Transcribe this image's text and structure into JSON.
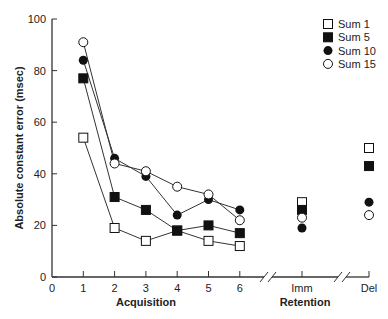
{
  "chart_data": {
    "type": "line",
    "title": "",
    "xlabel": "Acquisition",
    "xlabel_secondary": "Retention",
    "ylabel": "Absolute constant error (msec)",
    "ylim": [
      0,
      100
    ],
    "yticks": [
      0,
      20,
      40,
      60,
      80,
      100
    ],
    "xticks": [
      "0",
      "1",
      "2",
      "3",
      "4",
      "5",
      "6",
      "Imm",
      "Del"
    ],
    "categories": [
      "1",
      "2",
      "3",
      "4",
      "5",
      "6",
      "Imm",
      "Del"
    ],
    "grid": false,
    "legend_position": "top-right",
    "axis_breaks": [
      "between 6 and Imm",
      "between Imm and Del"
    ],
    "connected_segment": [
      "1",
      "2",
      "3",
      "4",
      "5",
      "6"
    ],
    "series": [
      {
        "name": "Sum 1",
        "marker": "open-square",
        "values": [
          54,
          19,
          14,
          18,
          14,
          12,
          29,
          50
        ]
      },
      {
        "name": "Sum 5",
        "marker": "filled-square",
        "values": [
          77,
          31,
          26,
          18,
          20,
          17,
          26,
          43
        ]
      },
      {
        "name": "Sum 10",
        "marker": "filled-circle",
        "values": [
          84,
          46,
          39,
          24,
          30,
          26,
          19,
          29
        ]
      },
      {
        "name": "Sum 15",
        "marker": "open-circle",
        "values": [
          91,
          44,
          41,
          35,
          32,
          22,
          23,
          24
        ]
      }
    ]
  },
  "legend": {
    "items": [
      {
        "label": "Sum 1",
        "marker": "open-square"
      },
      {
        "label": "Sum 5",
        "marker": "filled-square"
      },
      {
        "label": "Sum 10",
        "marker": "filled-circle"
      },
      {
        "label": "Sum 15",
        "marker": "open-circle"
      }
    ]
  },
  "axes": {
    "y_title": "Absolute constant error (msec)",
    "x_title_acquisition": "Acquisition",
    "x_title_retention": "Retention"
  },
  "colors": {
    "ink": "#111111",
    "axis": "#333333",
    "background": "#ffffff"
  }
}
